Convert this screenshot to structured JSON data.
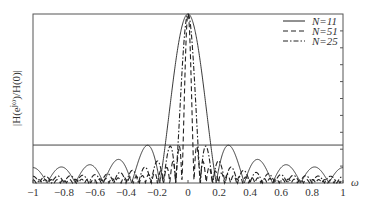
{
  "chart_data": {
    "type": "line",
    "title": "",
    "xlabel": "ω",
    "ylabel": "|H(e^{jω})/H(0)|",
    "xlim": [
      -1,
      1
    ],
    "ylim": [
      0,
      1
    ],
    "x_ticks": [
      "-1",
      "-0.8",
      "-0.6",
      "-0.4",
      "-0.2",
      "0",
      "0.2",
      "0.4",
      "0.6",
      "0.8",
      "1"
    ],
    "grid": false,
    "legend_position": "upper right",
    "reference_line": {
      "y": 0.2245,
      "description": "horizontal reference at first sidelobe level"
    },
    "series": [
      {
        "name": "N=11",
        "N": 11,
        "style": "solid",
        "formula": "|sin(Nπω/2)/(N sin(πω/2))|",
        "first_null": 0.182,
        "peak": 1.0
      },
      {
        "name": "N=51",
        "N": 51,
        "style": "dashed",
        "formula": "|sin(Nπω/2)/(N sin(πω/2))|",
        "first_null": 0.039,
        "peak": 1.0
      },
      {
        "name": "N=25",
        "N": 25,
        "style": "dash-dot",
        "formula": "|sin(Nπω/2)/(N sin(πω/2))|",
        "first_null": 0.08,
        "peak": 1.0
      }
    ]
  },
  "legend": {
    "items": [
      {
        "label": "N=11",
        "style": "solid"
      },
      {
        "label": "N=51",
        "style": "dashed"
      },
      {
        "label": "N=25",
        "style": "dash-dot"
      }
    ]
  },
  "axes": {
    "ylabel": "|H(e",
    "ylabel_sup": "jω",
    "ylabel_tail": ")/H(0)|",
    "xlabel": "ω"
  }
}
